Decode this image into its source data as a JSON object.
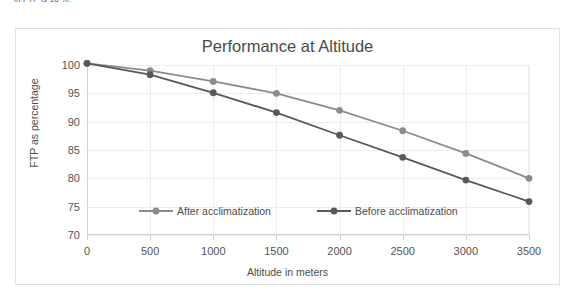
{
  "page": {
    "cropped_top_text": "in FTP is 16 %."
  },
  "chart_data": {
    "type": "line",
    "title": "Performance at Altitude",
    "xlabel": "Altitude in meters",
    "ylabel": "FTP as percentage",
    "x": [
      0,
      500,
      1000,
      1500,
      2000,
      2500,
      3000,
      3500
    ],
    "xtick_labels": [
      "0",
      "500",
      "1000",
      "1500",
      "2000",
      "2500",
      "3000",
      "3500"
    ],
    "ytick_labels": [
      "70",
      "75",
      "80",
      "85",
      "90",
      "95",
      "100"
    ],
    "yticks": [
      70,
      75,
      80,
      85,
      90,
      95,
      100
    ],
    "xlim": [
      0,
      3500
    ],
    "ylim": [
      70,
      100
    ],
    "grid": true,
    "legend_position": "inside-lower-center",
    "series": [
      {
        "name": "After acclimatization",
        "color": "#8c8c8c",
        "values": [
          100.3,
          99.0,
          97.1,
          95.0,
          92.0,
          88.4,
          84.4,
          80.0
        ]
      },
      {
        "name": "Before acclimatization",
        "color": "#595959",
        "values": [
          100.3,
          98.3,
          95.1,
          91.6,
          87.6,
          83.7,
          79.7,
          75.9
        ]
      }
    ]
  }
}
